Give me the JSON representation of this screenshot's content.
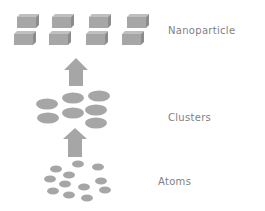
{
  "diagram": {
    "labels": {
      "nanoparticle": "Nanoparticle",
      "clusters": "Clusters",
      "atoms": "Atoms"
    },
    "stages": [
      "Atoms",
      "Clusters",
      "Nanoparticle"
    ],
    "colors": {
      "shape_fill": "#a6a6a6",
      "shape_dark": "#8c8c8c",
      "shape_light": "#bfbfbf",
      "arrow": "#a6a6a6",
      "text": "#7f7f7f",
      "background": "#ffffff"
    }
  }
}
